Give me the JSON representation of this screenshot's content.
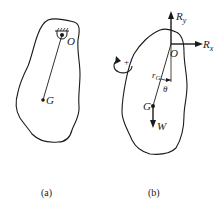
{
  "figure_a": {
    "caption": "(a)",
    "labels": {
      "pivot": "O",
      "center_of_mass": "G"
    }
  },
  "figure_b": {
    "caption": "(b)",
    "labels": {
      "pivot": "O",
      "center_of_mass": "G",
      "reaction_y": "R",
      "reaction_y_sub": "y",
      "reaction_x": "R",
      "reaction_x_sub": "x",
      "radius": "r",
      "radius_sub": "G",
      "angle": "θ",
      "weight": "W",
      "positive_rotation": "+"
    }
  },
  "colors": {
    "ink": "#1a1a1a",
    "background": "#ffffff"
  }
}
